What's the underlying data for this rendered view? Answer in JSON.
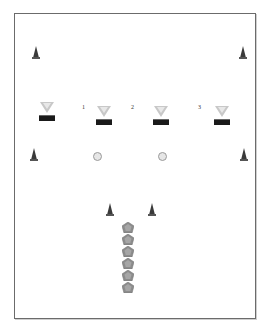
{
  "diagram": {
    "type": "drill-setup",
    "labels": [
      "1",
      "2",
      "3"
    ],
    "colors": {
      "frame": "#6b6b6b",
      "cone": "#3a3a3a",
      "triangle": "#c8c8c8",
      "bar": "#1a1a1a",
      "ball": "#e6e6e6",
      "pentagon": "#8c8c8c"
    },
    "cones": [
      {
        "x": 33,
        "y": 46
      },
      {
        "x": 240,
        "y": 46
      },
      {
        "x": 31,
        "y": 148
      },
      {
        "x": 241,
        "y": 148
      },
      {
        "x": 107,
        "y": 203
      },
      {
        "x": 149,
        "y": 203
      }
    ],
    "stations": [
      {
        "x": 39,
        "y": 102
      },
      {
        "x": 96,
        "y": 106
      },
      {
        "x": 153,
        "y": 106
      },
      {
        "x": 214,
        "y": 106
      }
    ],
    "station_labels": [
      {
        "text": "1",
        "x": 82,
        "y": 104
      },
      {
        "text": "2",
        "x": 131,
        "y": 104
      },
      {
        "text": "3",
        "x": 198,
        "y": 104
      }
    ],
    "balls": [
      {
        "x": 93,
        "y": 152
      },
      {
        "x": 158,
        "y": 152
      }
    ],
    "players": [
      {
        "x": 122,
        "y": 219
      },
      {
        "x": 122,
        "y": 231
      },
      {
        "x": 122,
        "y": 243
      },
      {
        "x": 122,
        "y": 255
      },
      {
        "x": 122,
        "y": 267
      },
      {
        "x": 122,
        "y": 279
      }
    ]
  }
}
